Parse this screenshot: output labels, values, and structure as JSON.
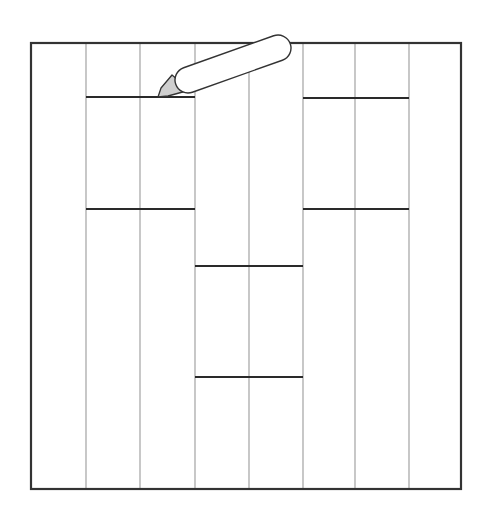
{
  "diagram": {
    "title": "",
    "colors": {
      "background": "#ffffff",
      "outline": "#333333",
      "thin_line": "#9a9a9a",
      "cut_line": "#2a2a2a",
      "blade": "#cfcfcf"
    },
    "sheet": {
      "x": 31,
      "y": 43,
      "width": 430,
      "height": 446
    },
    "vertical_lines_x": [
      86,
      140,
      195,
      249,
      303,
      355,
      409
    ],
    "cut_lines": [
      {
        "x1": 86,
        "x2": 195,
        "y": 97
      },
      {
        "x1": 86,
        "x2": 195,
        "y": 209
      },
      {
        "x1": 303,
        "x2": 409,
        "y": 98
      },
      {
        "x1": 303,
        "x2": 409,
        "y": 209
      },
      {
        "x1": 195,
        "x2": 303,
        "y": 266
      },
      {
        "x1": 195,
        "x2": 303,
        "y": 377
      }
    ],
    "knife": {
      "label": "utility-knife",
      "blade_tip": [
        158,
        97
      ],
      "handle_start": [
        188,
        80
      ],
      "handle_end": [
        278,
        48
      ],
      "handle_radius": 13
    }
  }
}
